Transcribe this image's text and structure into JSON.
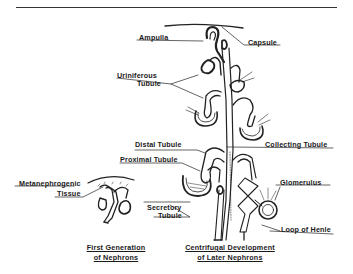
{
  "figure": {
    "labels": {
      "ampulla": "Ampulla",
      "capsule": "Capsule",
      "uriniferous_tubule_line1": "Uriniferous",
      "uriniferous_tubule_line2": "Tubule",
      "distal_tubule": "Distal Tubule",
      "collecting_tubule": "Collecting Tubule",
      "proximal_tubule": "Proximal Tubule",
      "metanephrogenic_line1": "Metanephrogenic",
      "metanephrogenic_line2": "Tissue",
      "secretory_line1": "Secretory",
      "secretory_line2": "Tubule",
      "glomerulus": "Glomerulus",
      "loop_of_henle": "Loop of Henle"
    },
    "captions": {
      "left_line1": "First Generation",
      "left_line2": "of Nephrons",
      "right_line1": "Centrifugal Development",
      "right_line2": "of Later Nephrons"
    },
    "colors": {
      "ink": "#1a1a1a",
      "background": "#ffffff"
    }
  }
}
